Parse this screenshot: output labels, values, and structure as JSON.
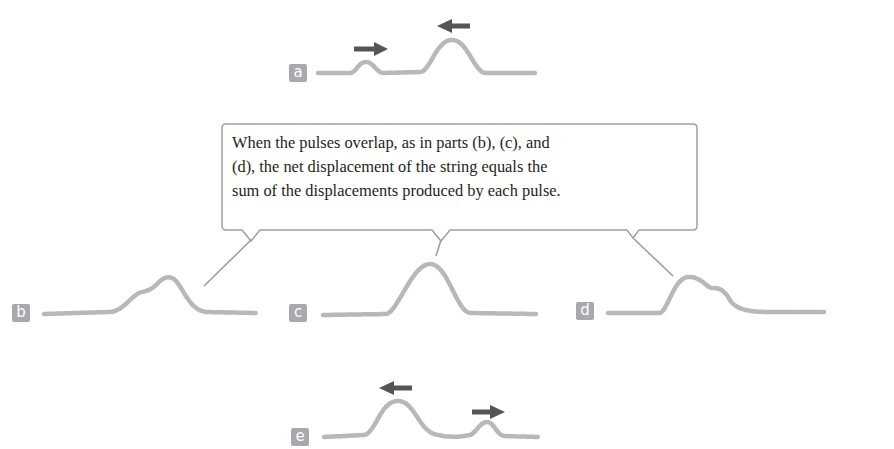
{
  "callout": {
    "lines": [
      "When the pulses overlap, as in parts (b), (c), and",
      "(d), the net displacement of the string equals the",
      "sum of the displacements produced by each pulse."
    ]
  },
  "panels": [
    {
      "label": "a",
      "description": "two pulses approaching each other: small pulse moving right, large pulse moving left",
      "arrows": [
        "right",
        "left"
      ]
    },
    {
      "label": "b",
      "description": "pulses begin to overlap"
    },
    {
      "label": "c",
      "description": "pulses fully overlap, single combined pulse"
    },
    {
      "label": "d",
      "description": "pulses separating after overlap"
    },
    {
      "label": "e",
      "description": "pulses pass through each other: large pulse moving left, small pulse moving right",
      "arrows": [
        "left",
        "right"
      ]
    }
  ],
  "colors": {
    "string": "#b8b8b8",
    "arrow": "#555555",
    "badge": "#a7a9ac",
    "callout_border": "#a0a0a0",
    "text": "#231f20"
  }
}
